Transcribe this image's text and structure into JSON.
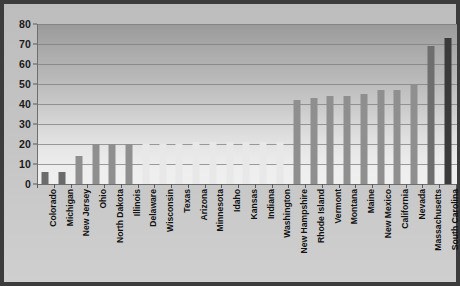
{
  "chart_data": {
    "type": "bar",
    "title": "",
    "subtitle": "",
    "xlabel": "",
    "ylabel": "",
    "ylim": [
      0,
      80
    ],
    "y_ticks": [
      0,
      10,
      20,
      30,
      40,
      50,
      60,
      70,
      80
    ],
    "grid": true,
    "legend": "none",
    "orientation": "vertical",
    "categories": [
      "Colorado",
      "Michigan",
      "New Jersey",
      "Ohio",
      "North Dakota",
      "Illinois",
      "Delaware",
      "Wisconsin",
      "Texas",
      "Arizona",
      "Minnesota",
      "Idaho",
      "Kansas",
      "Indiana",
      "Washington",
      "New Hampshire",
      "Rhode Island",
      "Vermont",
      "Montana",
      "Maine",
      "New Mexico",
      "California",
      "Nevada",
      "Massachusetts",
      "South Carolina"
    ],
    "values": [
      6,
      6,
      14,
      20,
      20,
      20,
      20,
      20,
      20,
      21,
      21,
      21,
      21,
      21,
      21,
      42,
      43,
      44,
      44,
      45,
      47,
      47,
      50,
      69,
      73
    ],
    "bar_colors": [
      "#6b6b6b",
      "#6b6b6b",
      "#8f8f8f",
      "#8f8f8f",
      "#8f8f8f",
      "#8f8f8f",
      "#e8e8e8",
      "#e8e8e8",
      "#e8e8e8",
      "#e8e8e8",
      "#e8e8e8",
      "#e8e8e8",
      "#e8e8e8",
      "#e8e8e8",
      "#e8e8e8",
      "#8f8f8f",
      "#8f8f8f",
      "#8f8f8f",
      "#8f8f8f",
      "#8f8f8f",
      "#8f8f8f",
      "#8f8f8f",
      "#8f8f8f",
      "#6e6e6e",
      "#3a3a3a"
    ]
  },
  "style": {
    "frame_color": "#3c3c3c",
    "gridline_color": "#7d7d7d",
    "axis_color": "#6e6e6e",
    "tick_label_color": "#1a1a1a",
    "category_label_color": "#111111",
    "plot_background_top": "#9a9a9a",
    "plot_background_bottom": "#f0efef",
    "figure_background": "#c4c4c4"
  }
}
